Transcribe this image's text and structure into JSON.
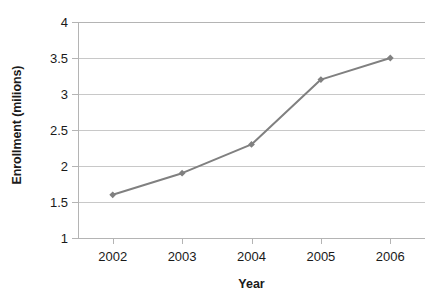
{
  "chart_data": {
    "type": "line",
    "title": "",
    "xlabel": "Year",
    "ylabel": "Enrollment (milions)",
    "x": [
      2002,
      2003,
      2004,
      2005,
      2006
    ],
    "categories": [
      "2002",
      "2003",
      "2004",
      "2005",
      "2006"
    ],
    "values": [
      1.6,
      1.9,
      2.3,
      3.2,
      3.5
    ],
    "series": [
      {
        "name": "Enrollment",
        "values": [
          1.6,
          1.9,
          2.3,
          3.2,
          3.5
        ]
      }
    ],
    "ylim": [
      1,
      4
    ],
    "ytick_labels": [
      "1",
      "1.5",
      "2",
      "2.5",
      "3",
      "3.5",
      "4"
    ],
    "ytick_values": [
      1,
      1.5,
      2,
      2.5,
      3,
      3.5,
      4
    ],
    "xtick_labels": [
      "2002",
      "2003",
      "2004",
      "2005",
      "2006"
    ],
    "grid": "horizontal",
    "legend": "none",
    "marker": "diamond",
    "colors": {
      "series": "#808080",
      "gridline": "#c8c8c8",
      "axis": "#b4b4b4",
      "text": "#1a1a1a",
      "background": "#ffffff"
    }
  }
}
